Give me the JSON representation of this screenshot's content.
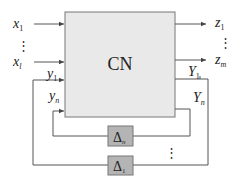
{
  "diagram": {
    "main_block": {
      "label": "CN"
    },
    "inputs": [
      {
        "name": "x",
        "sub": "1"
      },
      {
        "name": "x",
        "sub": "l"
      }
    ],
    "input_ellipsis": "⋮",
    "outputs": [
      {
        "name": "z",
        "sub": "1"
      },
      {
        "name": "z",
        "sub": "m"
      }
    ],
    "output_ellipsis": "⋮",
    "feedback_inputs": [
      {
        "name": "y",
        "sub": "1"
      },
      {
        "name": "y",
        "sub": "n"
      }
    ],
    "feedback_outputs": [
      {
        "name": "Y",
        "sub": "1"
      },
      {
        "name": "Y",
        "sub": "n"
      }
    ],
    "uncertainty_blocks": [
      {
        "name": "Δ",
        "sub": "n"
      },
      {
        "name": "Δ",
        "sub": "1"
      }
    ],
    "loop_ellipsis": "⋮",
    "colors": {
      "main_block_fill": "#e9e9e9",
      "delta_block_fill": "#b4b4b4",
      "line": "#555555"
    }
  }
}
